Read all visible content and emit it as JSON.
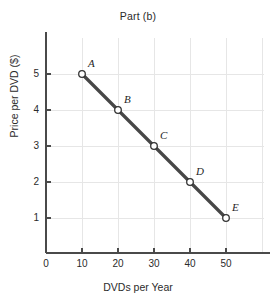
{
  "chart_data": {
    "type": "line",
    "title": "Part (b)",
    "xlabel": "DVDs per Year",
    "ylabel": "Price per DVD ($)",
    "xlim": [
      0,
      56
    ],
    "ylim": [
      0,
      5.8
    ],
    "grid": true,
    "legend": "none",
    "x_ticks": [
      "0",
      "10",
      "20",
      "30",
      "40",
      "50"
    ],
    "x_tick_values": [
      0,
      10,
      20,
      30,
      40,
      50
    ],
    "y_ticks": [
      "1",
      "2",
      "3",
      "4",
      "5"
    ],
    "y_tick_values": [
      1,
      2,
      3,
      4,
      5
    ],
    "x": [
      10,
      20,
      30,
      40,
      50
    ],
    "values": [
      5,
      4,
      3,
      2,
      1
    ],
    "point_labels": [
      "A",
      "B",
      "C",
      "D",
      "E"
    ],
    "series": [
      {
        "name": "Demand",
        "x": [
          10,
          20,
          30,
          40,
          50
        ],
        "values": [
          5,
          4,
          3,
          2,
          1
        ]
      }
    ],
    "annotations": [
      {
        "label": "A",
        "x": 10,
        "y": 5
      },
      {
        "label": "B",
        "x": 20,
        "y": 4
      },
      {
        "label": "C",
        "x": 30,
        "y": 3
      },
      {
        "label": "D",
        "x": 40,
        "y": 2
      },
      {
        "label": "E",
        "x": 50,
        "y": 1
      }
    ],
    "colors": {
      "line": "#474747",
      "marker_fill": "#ffffff",
      "marker_edge": "#333333",
      "axis": "#4a4a4a",
      "grid": "#e6e6e6",
      "text": "#2b2b2b",
      "background": "#ffffff"
    }
  }
}
